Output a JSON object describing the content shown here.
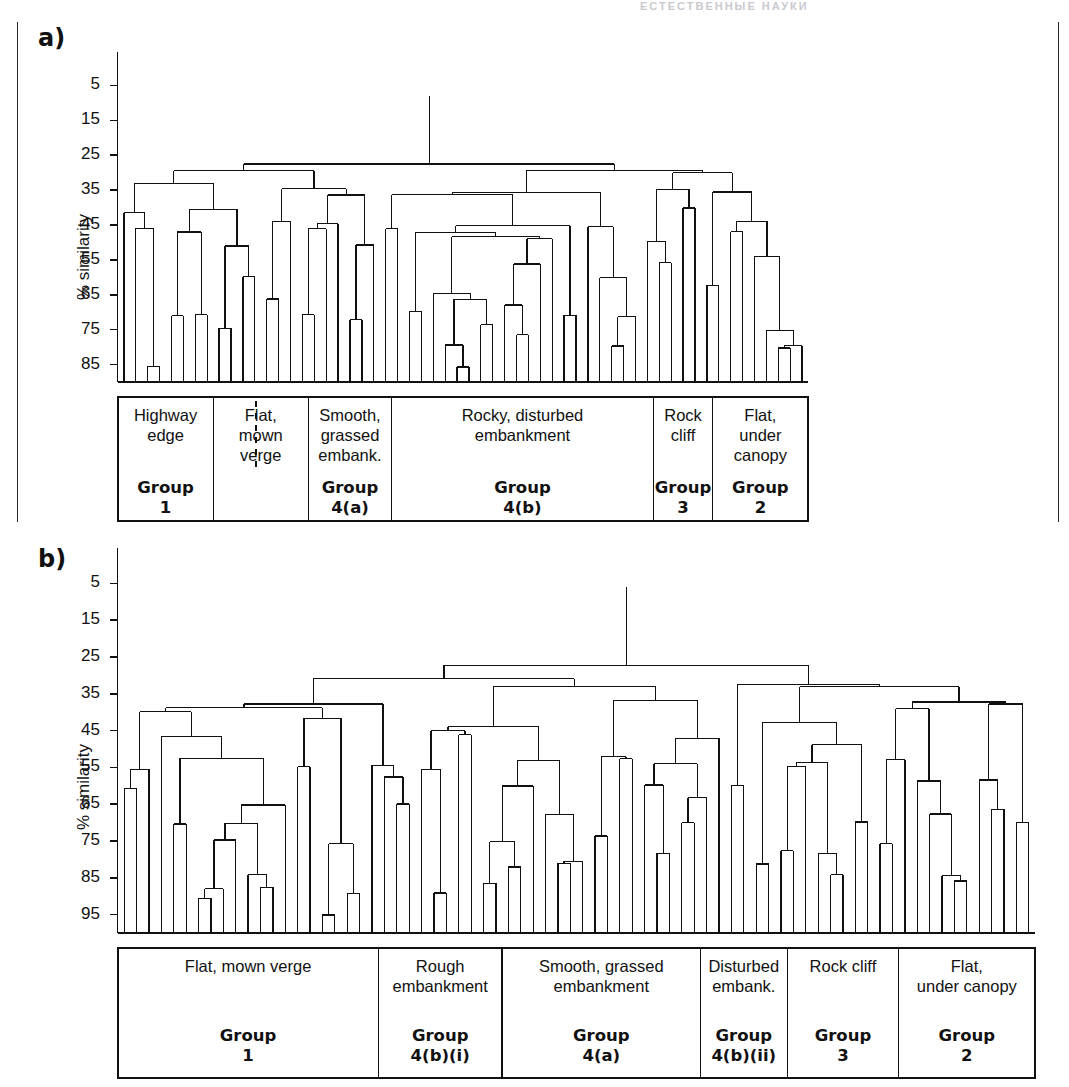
{
  "page": {
    "header_ghost": "ЕСТЕСТВЕННЫЕ НАУКИ",
    "panel_a_label": "a)",
    "panel_b_label": "b)"
  },
  "chart_data": [
    {
      "type": "dendrogram",
      "panel": "a",
      "title": "",
      "ylabel": "% similarity",
      "ytick_labels": [
        "5",
        "15",
        "25",
        "35",
        "45",
        "55",
        "65",
        "75",
        "85"
      ],
      "ytick_values": [
        5,
        15,
        25,
        35,
        45,
        55,
        65,
        75,
        85
      ],
      "ylim": [
        0,
        90
      ],
      "y_axis_inverted": true,
      "grid": false,
      "n_leaves": 58,
      "root_merge_similarity": 8,
      "habitat_categories": [
        {
          "label": "Highway\nedge",
          "group": "Group\n1",
          "leaf_start": 0,
          "leaf_end": 8
        },
        {
          "label": "Flat,\nmown\nverge",
          "group": "",
          "leaf_start": 8,
          "leaf_end": 16
        },
        {
          "label": "Smooth,\ngrassed\nembank.",
          "group": "Group\n4(a)",
          "leaf_start": 16,
          "leaf_end": 23
        },
        {
          "label": "Rocky, disturbed\nembankment",
          "group": "Group\n4(b)",
          "leaf_start": 23,
          "leaf_end": 45
        },
        {
          "label": "Rock\ncliff",
          "group": "Group\n3",
          "leaf_start": 45,
          "leaf_end": 50
        },
        {
          "label": "Flat,\nunder\ncanopy",
          "group": "Group\n2",
          "leaf_start": 50,
          "leaf_end": 58
        }
      ],
      "merges": [
        {
          "left": 0,
          "right": 1,
          "height": 41
        },
        {
          "left": 2,
          "right": 3,
          "height": 86
        },
        {
          "left": 4,
          "right": 5,
          "height": 71
        },
        {
          "left": 6,
          "right": 7,
          "height": 70
        },
        {
          "left": 8,
          "right": 9,
          "height": 75
        },
        {
          "left": 10,
          "right": 11,
          "height": 60
        },
        {
          "left": 12,
          "right": 13,
          "height": 66
        },
        {
          "left": 14,
          "right": 15,
          "height": 35
        },
        {
          "left": 16,
          "right": 17,
          "height": 46
        },
        {
          "left": 18,
          "right": 19,
          "height": 36
        },
        {
          "left": 20,
          "right": 21,
          "height": 51
        },
        {
          "left": 22,
          "right": 23,
          "height": 46
        },
        {
          "left": 24,
          "right": 25,
          "height": 69
        },
        {
          "left": 26,
          "right": 27,
          "height": 65
        },
        {
          "left": 28,
          "right": 29,
          "height": 86
        },
        {
          "left": 30,
          "right": 31,
          "height": 73
        },
        {
          "left": 32,
          "right": 33,
          "height": 68
        },
        {
          "left": 34,
          "right": 35,
          "height": 56
        },
        {
          "left": 36,
          "right": 37,
          "height": 45
        },
        {
          "left": 38,
          "right": 39,
          "height": 36
        },
        {
          "left": 40,
          "right": 41,
          "height": 60
        },
        {
          "left": 42,
          "right": 43,
          "height": 71
        },
        {
          "left": 44,
          "right": 45,
          "height": 50
        },
        {
          "left": 46,
          "right": 47,
          "height": 35
        },
        {
          "left": 48,
          "right": 49,
          "height": 30
        },
        {
          "left": 50,
          "right": 51,
          "height": 36
        },
        {
          "left": 52,
          "right": 53,
          "height": 44
        },
        {
          "left": 54,
          "right": 55,
          "height": 75
        },
        {
          "left": 56,
          "right": 57,
          "height": 80
        }
      ],
      "notes": "Hierarchical cluster dendrogram of roadside vegetation samples; branches descend from low % similarity at top to high % similarity at bottom."
    },
    {
      "type": "dendrogram",
      "panel": "b",
      "title": "",
      "ylabel": "% similarity",
      "ytick_labels": [
        "5",
        "15",
        "25",
        "35",
        "45",
        "55",
        "65",
        "75",
        "85",
        "95"
      ],
      "ytick_values": [
        5,
        15,
        25,
        35,
        45,
        55,
        65,
        75,
        85,
        95
      ],
      "ylim": [
        0,
        100
      ],
      "y_axis_inverted": true,
      "grid": false,
      "n_leaves": 74,
      "root_merge_similarity": 6,
      "habitat_categories": [
        {
          "label": "Flat, mown verge",
          "group": "Group\n1",
          "leaf_start": 0,
          "leaf_end": 21
        },
        {
          "label": "Rough\nembankment",
          "group": "Group\n4(b)(i)",
          "leaf_start": 21,
          "leaf_end": 31
        },
        {
          "label": "Smooth, grassed\nembankment",
          "group": "Group\n4(a)",
          "leaf_start": 31,
          "leaf_end": 47
        },
        {
          "label": "Disturbed\nembank.",
          "group": "Group\n4(b)(ii)",
          "leaf_start": 47,
          "leaf_end": 54
        },
        {
          "label": "Rock cliff",
          "group": "Group\n3",
          "leaf_start": 54,
          "leaf_end": 63
        },
        {
          "label": "Flat,\nunder canopy",
          "group": "Group\n2",
          "leaf_start": 63,
          "leaf_end": 74
        }
      ],
      "merges": [
        {
          "left": 0,
          "right": 1,
          "height": 60
        },
        {
          "left": 2,
          "right": 3,
          "height": 40
        },
        {
          "left": 4,
          "right": 5,
          "height": 70
        },
        {
          "left": 6,
          "right": 7,
          "height": 90
        },
        {
          "left": 8,
          "right": 9,
          "height": 75
        },
        {
          "left": 10,
          "right": 11,
          "height": 84
        },
        {
          "left": 12,
          "right": 13,
          "height": 65
        },
        {
          "left": 14,
          "right": 15,
          "height": 55
        },
        {
          "left": 16,
          "right": 17,
          "height": 95
        },
        {
          "left": 18,
          "right": 19,
          "height": 89
        },
        {
          "left": 20,
          "right": 21,
          "height": 55
        },
        {
          "left": 22,
          "right": 23,
          "height": 65
        },
        {
          "left": 24,
          "right": 25,
          "height": 55
        },
        {
          "left": 26,
          "right": 27,
          "height": 45
        },
        {
          "left": 28,
          "right": 29,
          "height": 44
        },
        {
          "left": 30,
          "right": 31,
          "height": 75
        },
        {
          "left": 32,
          "right": 33,
          "height": 60
        },
        {
          "left": 34,
          "right": 35,
          "height": 68
        },
        {
          "left": 36,
          "right": 37,
          "height": 80
        },
        {
          "left": 38,
          "right": 39,
          "height": 74
        },
        {
          "left": 40,
          "right": 41,
          "height": 53
        },
        {
          "left": 42,
          "right": 43,
          "height": 59
        },
        {
          "left": 44,
          "right": 45,
          "height": 54
        },
        {
          "left": 46,
          "right": 47,
          "height": 63
        },
        {
          "left": 48,
          "right": 49,
          "height": 27
        },
        {
          "left": 50,
          "right": 51,
          "height": 33
        },
        {
          "left": 52,
          "right": 53,
          "height": 43
        },
        {
          "left": 54,
          "right": 55,
          "height": 54
        },
        {
          "left": 56,
          "right": 57,
          "height": 79
        },
        {
          "left": 58,
          "right": 59,
          "height": 49
        },
        {
          "left": 60,
          "right": 61,
          "height": 33
        },
        {
          "left": 62,
          "right": 63,
          "height": 53
        },
        {
          "left": 64,
          "right": 65,
          "height": 59
        },
        {
          "left": 66,
          "right": 67,
          "height": 84
        },
        {
          "left": 68,
          "right": 69,
          "height": 38
        },
        {
          "left": 70,
          "right": 71,
          "height": 66
        },
        {
          "left": 72,
          "right": 73,
          "height": 70
        }
      ],
      "notes": "Second hierarchical cluster dendrogram with finer subdivision of group 4(b) into 4(b)(i) and 4(b)(ii)."
    }
  ]
}
